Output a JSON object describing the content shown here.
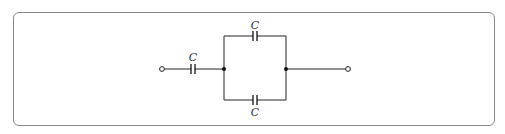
{
  "diagram": {
    "type": "circuit",
    "components": [
      {
        "id": "c-series",
        "type": "capacitor",
        "label": "C"
      },
      {
        "id": "c-parallel-top",
        "type": "capacitor",
        "label": "C"
      },
      {
        "id": "c-parallel-bottom",
        "type": "capacitor",
        "label": "C"
      }
    ],
    "terminals": [
      "left",
      "right"
    ],
    "junctions": 2
  },
  "colors": {
    "wire": "#222222",
    "frame": "#8a8a8a",
    "label": "#333333"
  }
}
